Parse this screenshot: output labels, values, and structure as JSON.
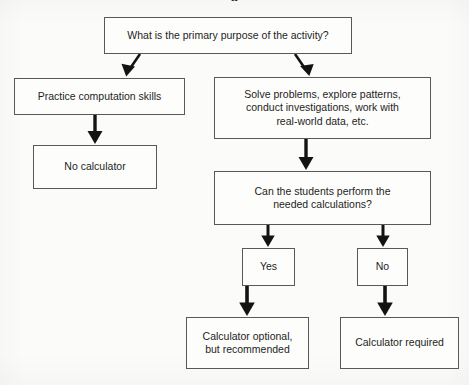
{
  "figure": {
    "type": "flowchart",
    "title_fragment": "g",
    "orientation": "top-down",
    "background_color": "#fbfbfa",
    "box_border_color": "#58585a",
    "box_fill_color": "#fdfdfc",
    "arrow_color": "#131313",
    "text_color": "#1d1d1d"
  },
  "nodes": {
    "purpose": {
      "id": "purpose",
      "label": "What is the primary purpose of the activity?",
      "lines": [
        "What is the primary purpose of the activity?"
      ],
      "shape": "rectangle"
    },
    "practice": {
      "id": "practice",
      "label": "Practice computation skills",
      "lines": [
        "Practice computation skills"
      ],
      "shape": "rectangle"
    },
    "solve": {
      "id": "solve",
      "label": "Solve problems, explore patterns, conduct investigations, work with real-world data, etc.",
      "lines": [
        "Solve problems, explore patterns,",
        "conduct investigations, work with",
        "real-world data, etc."
      ],
      "shape": "rectangle"
    },
    "no_calculator": {
      "id": "no_calculator",
      "label": "No calculator",
      "lines": [
        "No calculator"
      ],
      "shape": "rectangle"
    },
    "can_perform": {
      "id": "can_perform",
      "label": "Can the students perform the needed calculations?",
      "lines": [
        "Can the students perform the",
        "needed calculations?"
      ],
      "shape": "rectangle"
    },
    "yes": {
      "id": "yes",
      "label": "Yes",
      "lines": [
        "Yes"
      ],
      "shape": "rectangle"
    },
    "no": {
      "id": "no",
      "label": "No",
      "lines": [
        "No"
      ],
      "shape": "rectangle"
    },
    "calculator_optional": {
      "id": "calculator_optional",
      "label": "Calculator optional, but recommended",
      "lines": [
        "Calculator optional,",
        "but recommended"
      ],
      "shape": "rectangle"
    },
    "calculator_required": {
      "id": "calculator_required",
      "label": "Calculator required",
      "lines": [
        "Calculator required"
      ],
      "shape": "rectangle"
    }
  },
  "edges": [
    {
      "id": "purpose-to-practice",
      "from": "purpose",
      "to": "practice",
      "style": "diagonal-down-left",
      "label": ""
    },
    {
      "id": "purpose-to-solve",
      "from": "purpose",
      "to": "solve",
      "style": "diagonal-down-right",
      "label": ""
    },
    {
      "id": "practice-to-no-calculator",
      "from": "practice",
      "to": "no_calculator",
      "style": "vertical",
      "label": ""
    },
    {
      "id": "solve-to-can-perform",
      "from": "solve",
      "to": "can_perform",
      "style": "vertical",
      "label": ""
    },
    {
      "id": "can-perform-to-yes",
      "from": "can_perform",
      "to": "yes",
      "style": "vertical",
      "label": ""
    },
    {
      "id": "can-perform-to-no",
      "from": "can_perform",
      "to": "no",
      "style": "vertical",
      "label": ""
    },
    {
      "id": "yes-to-calculator-optional",
      "from": "yes",
      "to": "calculator_optional",
      "style": "vertical",
      "label": ""
    },
    {
      "id": "no-to-calculator-required",
      "from": "no",
      "to": "calculator_required",
      "style": "vertical",
      "label": ""
    }
  ]
}
